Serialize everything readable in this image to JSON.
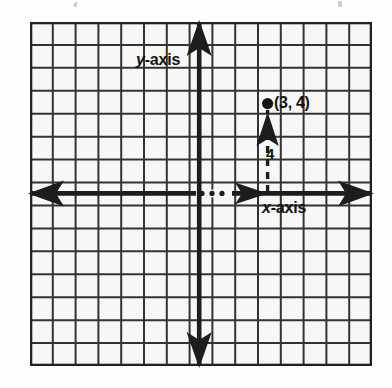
{
  "figure": {
    "type": "coordinate-plane-diagram",
    "background_color": "#f7f7f5",
    "ink_color": "#222222"
  },
  "grid": {
    "columns": 15,
    "rows": 15,
    "cell_size_px": 22.8,
    "line_color": "#333333",
    "border_color": "#222222"
  },
  "axes": {
    "x_axis": {
      "label": "x-axis",
      "label_italic_char": "x",
      "label_rest": "-axis",
      "row_from_top": 8,
      "left_arrow": true,
      "right_arrow": true,
      "interior_arrow": true,
      "dotted_segment": true,
      "dot_count": 3
    },
    "y_axis": {
      "label": "y-axis",
      "label_italic_char": "y",
      "label_rest": "-axis",
      "column_from_left": 8,
      "up_arrow": true,
      "down_arrow": true
    }
  },
  "point": {
    "label": "(3, 4)",
    "x": 3,
    "y": 4,
    "marker": "filled-dot"
  },
  "measurement": {
    "label": "4",
    "value": 4,
    "orientation": "vertical",
    "dashed": true,
    "arrow": "up"
  }
}
